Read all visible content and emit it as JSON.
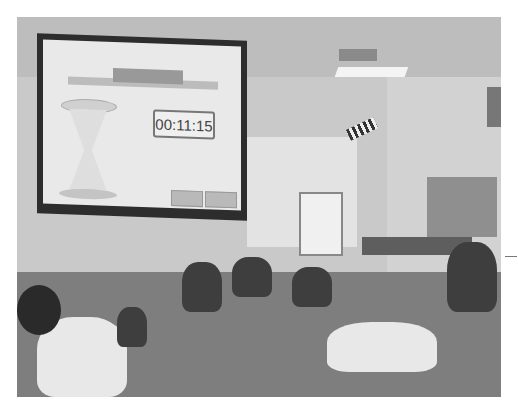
{
  "scene": {
    "description": "Classroom with students reading on the floor while a countdown timer is projected on a screen",
    "projected_screen": {
      "timer_display": "00:11:15",
      "graphic": "hourglass",
      "buttons": [
        "",
        ""
      ]
    }
  }
}
